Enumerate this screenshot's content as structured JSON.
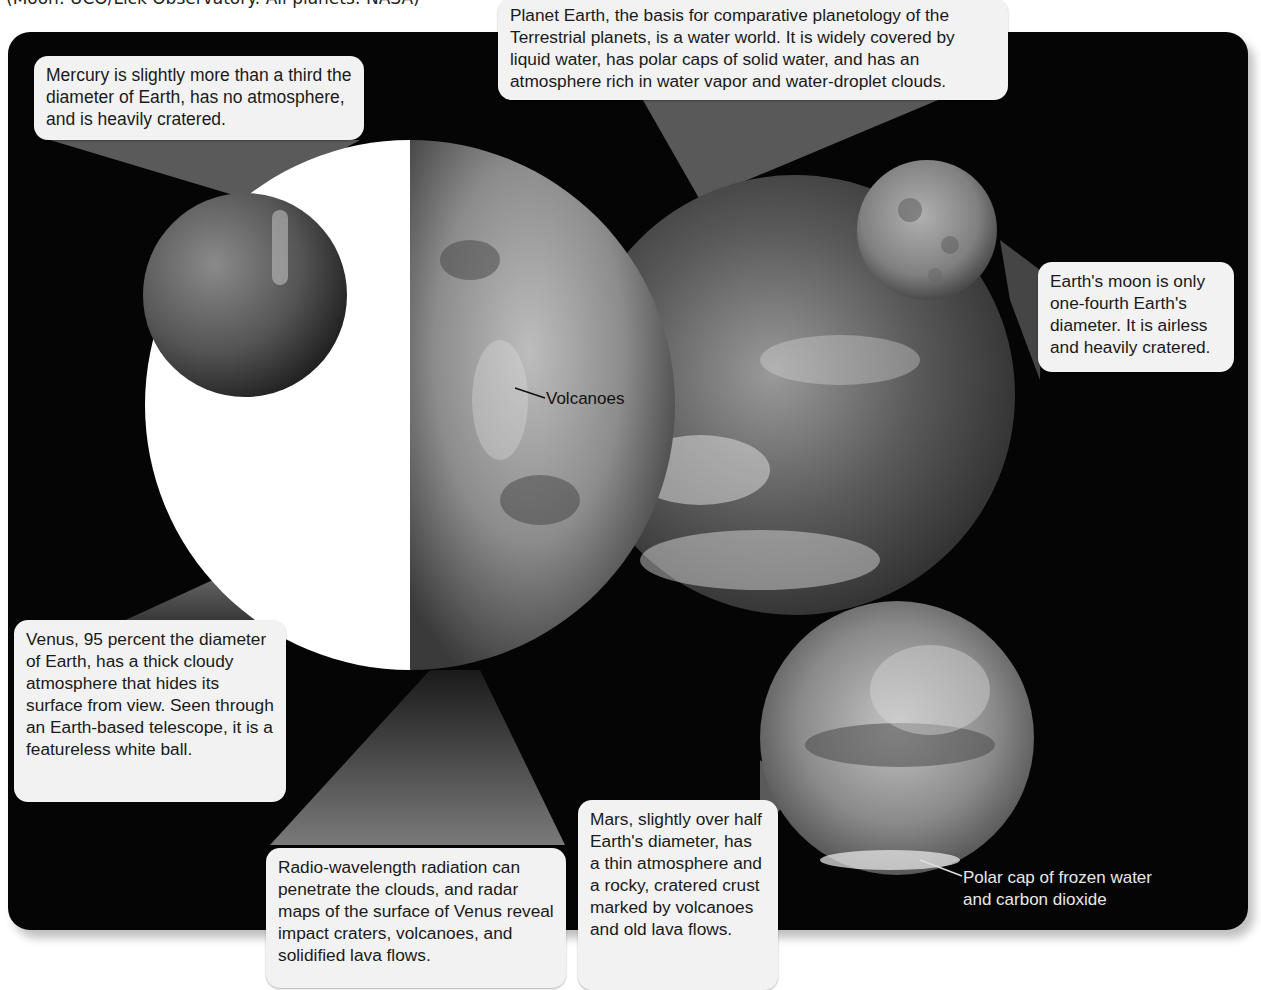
{
  "credit": "(Moon: UCO/Lick Observatory. All planets: NASA)",
  "callouts": {
    "earth": "Planet Earth, the basis for comparative planetology of the Terrestrial planets, is a water world. It is widely covered by liquid water, has polar caps of solid water, and has an atmosphere rich in water vapor and water-droplet clouds.",
    "mercury": "Mercury is slightly more than a third the diameter of Earth, has no atmosphere, and is heavily cratered.",
    "moon": "Earth's moon is only one-fourth Earth's diameter. It is airless and heavily cratered.",
    "venus": "Venus, 95 percent the diameter of Earth, has a thick cloudy atmosphere that hides its surface from view. Seen through an Earth-based telescope, it is a featureless white ball.",
    "radar": "Radio-wavelength radiation can penetrate the clouds, and radar maps of the surface of Venus reveal impact craters, volcanoes, and solidified lava flows.",
    "mars": "Mars, slightly over half Earth's diameter, has a thin atmosphere and a rocky, cratered crust marked by volcanoes and old lava flows."
  },
  "labels": {
    "volcanoes": "Volcanoes",
    "polar_cap_line1": "Polar cap of frozen water",
    "polar_cap_line2": "and carbon dioxide"
  },
  "colors": {
    "background": "#050505",
    "callout": "#f2f2f2",
    "text": "#1a1a1a"
  }
}
